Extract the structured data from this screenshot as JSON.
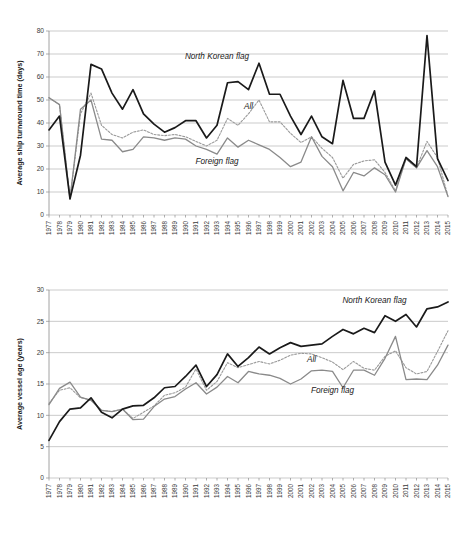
{
  "figure": {
    "panels": [
      "turnaround-time-panel",
      "vessel-age-panel"
    ]
  },
  "labels": {
    "north_korean_flag": "North Korean flag",
    "all": "All",
    "foreign_flag": "Foreign flag"
  },
  "colors": {
    "north_korean_flag": "#1a1a1a",
    "foreign_flag": "#8a8a8a",
    "all": "#9a9a9a",
    "gridline": "#b4b4b4",
    "background": "#ffffff"
  },
  "chart_data": [
    {
      "id": "turnaround-time-panel",
      "type": "line",
      "title": "",
      "xlabel": "",
      "ylabel": "Average ship turnaround time (days)",
      "ylim": [
        0,
        80
      ],
      "ytick_step": 10,
      "yticks": [
        0,
        10,
        20,
        30,
        40,
        50,
        60,
        70,
        80
      ],
      "grid": true,
      "legend_position": "inline-annotations",
      "x": [
        1977,
        1978,
        1979,
        1980,
        1981,
        1982,
        1983,
        1984,
        1985,
        1986,
        1987,
        1988,
        1989,
        1990,
        1991,
        1992,
        1993,
        1994,
        1995,
        1996,
        1997,
        1998,
        1999,
        2000,
        2001,
        2002,
        2003,
        2004,
        2005,
        2006,
        2007,
        2008,
        2009,
        2010,
        2011,
        2012,
        2013,
        2014,
        2015
      ],
      "categories": [
        "1977",
        "1978",
        "1979",
        "1980",
        "1981",
        "1982",
        "1983",
        "1984",
        "1985",
        "1986",
        "1987",
        "1988",
        "1989",
        "1990",
        "1991",
        "1992",
        "1993",
        "1994",
        "1995",
        "1996",
        "1997",
        "1998",
        "1999",
        "2000",
        "2001",
        "2002",
        "2003",
        "2004",
        "2005",
        "2006",
        "2007",
        "2008",
        "2009",
        "2010",
        "2011",
        "2012",
        "2013",
        "2014",
        "2015"
      ],
      "series": [
        {
          "name": "North Korean flag",
          "style": "solid-black",
          "values": [
            37,
            43,
            7,
            26,
            65.5,
            63.5,
            53,
            46,
            54.5,
            44,
            39.5,
            36,
            38,
            41,
            41,
            33.5,
            39,
            57.5,
            58,
            54.5,
            66,
            52.5,
            52.5,
            43,
            35,
            43,
            34,
            31,
            58.5,
            42,
            42,
            54,
            23,
            13,
            25,
            21,
            78,
            24.5,
            15
          ]
        },
        {
          "name": "All",
          "style": "dotted-gray",
          "values": [
            51,
            48,
            7,
            44,
            53,
            39,
            35,
            33.5,
            36,
            37,
            35,
            34.5,
            35,
            34,
            32,
            30,
            32.5,
            42,
            39,
            44,
            50,
            40.5,
            40.5,
            35.5,
            31.5,
            34,
            29,
            25,
            16,
            22,
            23.5,
            24,
            18.5,
            10.5,
            24.5,
            20.5,
            32,
            25,
            8
          ]
        },
        {
          "name": "Foreign flag",
          "style": "solid-gray",
          "values": [
            51,
            48,
            7,
            46,
            50,
            33,
            32.5,
            27.5,
            28.5,
            34,
            33.5,
            32.5,
            33.5,
            33,
            30,
            28.5,
            26.5,
            33.5,
            29.5,
            32.5,
            30.5,
            28.5,
            25,
            21,
            23,
            34,
            25.5,
            21,
            10.5,
            18.5,
            17,
            20.5,
            17.5,
            10,
            24.5,
            20.5,
            28,
            21,
            8
          ]
        }
      ],
      "annotations": [
        {
          "text": "North Korean flag",
          "x": 1993,
          "y": 68
        },
        {
          "text": "All",
          "x": 1996,
          "y": 46
        },
        {
          "text": "Foreign flag",
          "x": 1993,
          "y": 22
        }
      ]
    },
    {
      "id": "vessel-age-panel",
      "type": "line",
      "title": "",
      "xlabel": "",
      "ylabel": "Average vessel age (years)",
      "ylim": [
        0,
        30
      ],
      "ytick_step": 5,
      "yticks": [
        0,
        5,
        10,
        15,
        20,
        25,
        30
      ],
      "grid": true,
      "legend_position": "inline-annotations",
      "x": [
        1977,
        1978,
        1979,
        1980,
        1981,
        1982,
        1983,
        1984,
        1985,
        1986,
        1987,
        1988,
        1989,
        1990,
        1991,
        1992,
        1993,
        1994,
        1995,
        1996,
        1997,
        1998,
        1999,
        2000,
        2001,
        2002,
        2003,
        2004,
        2005,
        2006,
        2007,
        2008,
        2009,
        2010,
        2011,
        2012,
        2013,
        2014,
        2015
      ],
      "categories": [
        "1977",
        "1978",
        "1979",
        "1980",
        "1981",
        "1982",
        "1983",
        "1984",
        "1985",
        "1986",
        "1987",
        "1988",
        "1989",
        "1990",
        "1991",
        "1992",
        "1993",
        "1994",
        "1995",
        "1996",
        "1997",
        "1998",
        "1999",
        "2000",
        "2001",
        "2002",
        "2003",
        "2004",
        "2005",
        "2006",
        "2007",
        "2008",
        "2009",
        "2010",
        "2011",
        "2012",
        "2013",
        "2014",
        "2015"
      ],
      "series": [
        {
          "name": "North Korean flag",
          "style": "solid-black",
          "values": [
            6,
            9,
            11,
            11.2,
            12.8,
            10.5,
            9.6,
            11,
            11.5,
            11.6,
            12.8,
            14.4,
            14.6,
            16.2,
            18,
            14.6,
            16.5,
            19.8,
            17.8,
            19.2,
            20.9,
            19.8,
            20.8,
            21.6,
            21,
            21.2,
            21.4,
            22.6,
            23.7,
            23,
            23.9,
            23.2,
            25.9,
            25,
            26.1,
            24.1,
            27,
            27.3,
            28.1
          ]
        },
        {
          "name": "All",
          "style": "dotted-gray",
          "values": [
            11.9,
            14,
            14.4,
            12.8,
            12.5,
            10.8,
            10.6,
            11,
            9.5,
            10.5,
            11.5,
            13.2,
            13.6,
            14.5,
            17.4,
            14,
            15.4,
            18.4,
            17.6,
            18.1,
            18.6,
            18.2,
            18.8,
            19.6,
            19.9,
            19.8,
            19.2,
            18.5,
            17.3,
            18.6,
            17.5,
            17.2,
            19.4,
            20.3,
            17.6,
            16.6,
            17,
            20.2,
            23.5
          ]
        },
        {
          "name": "Foreign flag",
          "style": "solid-gray",
          "values": [
            11.7,
            14.3,
            15.3,
            12.9,
            12.4,
            10.8,
            10.6,
            11,
            9.3,
            9.4,
            11.4,
            12.6,
            13,
            14.2,
            15.2,
            13.4,
            14.5,
            16.2,
            15.2,
            17,
            16.6,
            16.4,
            15.9,
            15,
            15.8,
            17.1,
            17.2,
            17,
            14.4,
            17.2,
            17.2,
            16.4,
            19.1,
            22.6,
            15.7,
            15.8,
            15.7,
            18,
            21.2
          ]
        }
      ],
      "annotations": [
        {
          "text": "North Korean flag",
          "x": 2008,
          "y": 28
        },
        {
          "text": "All",
          "x": 2002,
          "y": 18.5
        },
        {
          "text": "Foreign flag",
          "x": 2004,
          "y": 13.5
        }
      ]
    }
  ]
}
